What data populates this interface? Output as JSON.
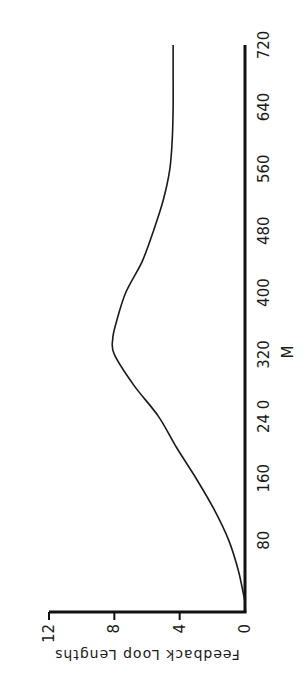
{
  "chart_data": {
    "type": "line",
    "orientation": "rotated-90-ccw",
    "title": "",
    "xlabel": "M",
    "ylabel": "Feedback Loop Lengths",
    "xlim": [
      0,
      720
    ],
    "ylim": [
      0,
      12
    ],
    "x_ticks": [
      80,
      160,
      240,
      320,
      400,
      480,
      560,
      640,
      720
    ],
    "x_tick_labels": [
      "80",
      "160",
      "24 0",
      "320",
      "400",
      "480",
      "560",
      "640",
      "720"
    ],
    "y_ticks": [
      0,
      4,
      8,
      12
    ],
    "y_tick_labels": [
      "0",
      "4",
      "8",
      "12"
    ],
    "grid": false,
    "legend": null,
    "series": [
      {
        "name": "Feedback Loop Lengths",
        "color": "#1a1a1a",
        "x": [
          0,
          40,
          80,
          120,
          160,
          200,
          240,
          280,
          320,
          340,
          360,
          400,
          440,
          480,
          520,
          560,
          600,
          640,
          680,
          720
        ],
        "values": [
          0,
          0.4,
          1.0,
          1.9,
          3.0,
          4.2,
          5.3,
          6.8,
          8.0,
          8.1,
          7.9,
          7.3,
          6.3,
          5.6,
          5.0,
          4.6,
          4.45,
          4.4,
          4.4,
          4.4
        ]
      }
    ]
  }
}
